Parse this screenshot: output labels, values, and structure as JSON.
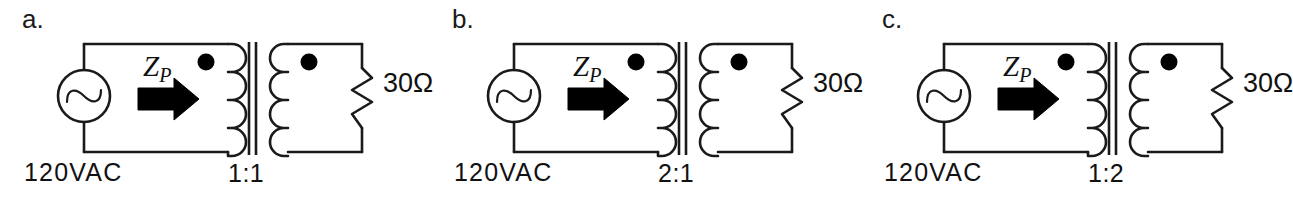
{
  "figure": {
    "background_color": "#ffffff",
    "line_color": "#1a1a1a",
    "fill_color": "#000000",
    "panel_count": 3
  },
  "common": {
    "source_label": "120VAC",
    "impedance_label_main": "Z",
    "impedance_label_sub": "P",
    "load_label": "30Ω",
    "source_icon": "ac-source-sine-icon",
    "arrow_icon": "right-arrow-icon",
    "dot_icon": "polarity-dot-icon",
    "resistor_icon": "zigzag-resistor-icon",
    "core_icon": "transformer-core-icon",
    "primary_coil_bumps": 4,
    "secondary_coil_bumps": 4
  },
  "panels": [
    {
      "id": "a",
      "label": "a.",
      "turns_ratio": "1:1",
      "source_label": "120VAC",
      "load_label": "30Ω",
      "impedance_label_main": "Z",
      "impedance_label_sub": "P"
    },
    {
      "id": "b",
      "label": "b.",
      "turns_ratio": "2:1",
      "source_label": "120VAC",
      "load_label": "30Ω",
      "impedance_label_main": "Z",
      "impedance_label_sub": "P"
    },
    {
      "id": "c",
      "label": "c.",
      "turns_ratio": "1:2",
      "source_label": "120VAC",
      "load_label": "30Ω",
      "impedance_label_main": "Z",
      "impedance_label_sub": "P"
    }
  ]
}
